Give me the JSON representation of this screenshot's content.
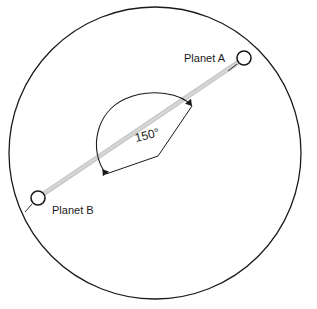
{
  "figure": {
    "type": "orbital-geometry-diagram",
    "background_color": "#ffffff",
    "stroke_color": "#1a1a1a",
    "beam_color": "#c8c8c8"
  },
  "orbit": {
    "name": "orbit-circle",
    "center_x": 155,
    "center_y": 153,
    "radius": 146,
    "stroke_width": 1.3
  },
  "beam": {
    "name": "line-of-sight-band",
    "x1": 36,
    "y1": 199,
    "x2": 246,
    "y2": 57,
    "width": 5,
    "color": "#c8c8c8"
  },
  "planets": [
    {
      "id": "planet-a",
      "label": "Planet A",
      "marker_x": 244,
      "marker_y": 58,
      "marker_r": 7,
      "label_x": 225,
      "label_y": 62,
      "leader_x1": 237,
      "leader_y1": 64,
      "leader_x2": 228,
      "leader_y2": 71
    },
    {
      "id": "planet-b",
      "label": "Planet B",
      "marker_x": 38,
      "marker_y": 198,
      "marker_r": 7,
      "label_x": 52,
      "label_y": 214,
      "leader_x1": 32,
      "leader_y1": 204,
      "leader_x2": 25,
      "leader_y2": 212
    }
  ],
  "angle": {
    "name": "angle-annotation",
    "value_label": "150°",
    "value_number": 150,
    "unit": "degrees",
    "text_x": 136,
    "text_y": 142,
    "text_rotation": -14,
    "arc_start_x": 106,
    "arc_start_y": 174,
    "arc_end_x": 192,
    "arc_end_y": 106,
    "vertex_x": 158,
    "vertex_y": 156,
    "arc_path": "M 106 174 C 88 150 96 112 125 99 C 152 87 182 94 192 106",
    "leg_a_path": "M 106 174 L 158 156",
    "leg_b_path": "M 158 156 L 192 106"
  }
}
